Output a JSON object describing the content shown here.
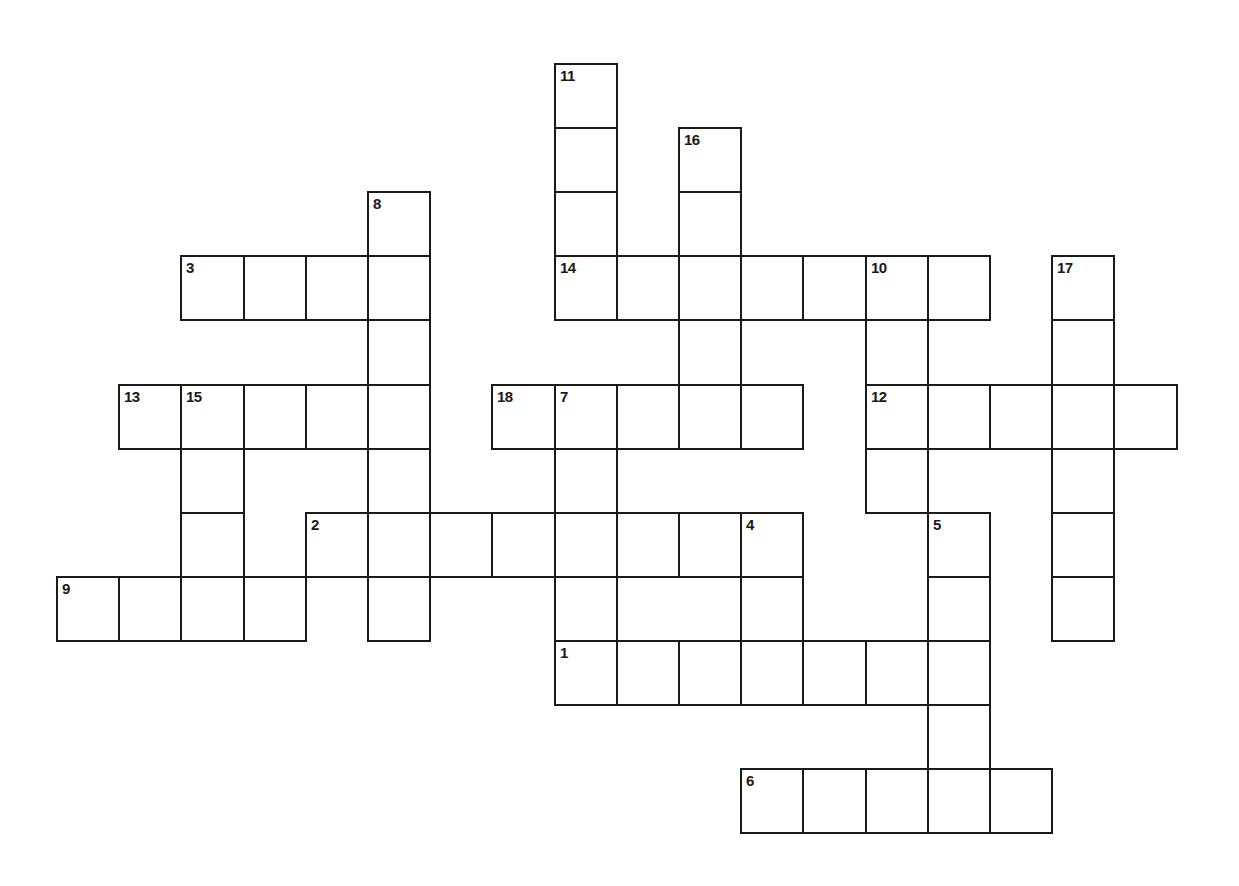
{
  "puzzle": {
    "grid": {
      "origin_x": 57,
      "origin_y": 64,
      "cell_w": 62.2,
      "cell_h": 64.1,
      "line_color": "#1a1a1a",
      "fill_color": "#ffffff"
    },
    "entries": [
      {
        "number": "1",
        "direction": "across",
        "row": 9,
        "col": 8,
        "length": 7
      },
      {
        "number": "2",
        "direction": "across",
        "row": 7,
        "col": 4,
        "length": 8
      },
      {
        "number": "3",
        "direction": "across",
        "row": 3,
        "col": 2,
        "length": 4
      },
      {
        "number": "4",
        "direction": "down",
        "row": 7,
        "col": 11,
        "length": 3
      },
      {
        "number": "5",
        "direction": "down",
        "row": 7,
        "col": 14,
        "length": 5
      },
      {
        "number": "6",
        "direction": "across",
        "row": 11,
        "col": 11,
        "length": 5
      },
      {
        "number": "7",
        "direction": "down",
        "row": 5,
        "col": 8,
        "length": 5
      },
      {
        "number": "8",
        "direction": "down",
        "row": 2,
        "col": 5,
        "length": 7
      },
      {
        "number": "9",
        "direction": "across",
        "row": 8,
        "col": 0,
        "length": 4
      },
      {
        "number": "10",
        "direction": "down",
        "row": 3,
        "col": 13,
        "length": 4
      },
      {
        "number": "11",
        "direction": "down",
        "row": 0,
        "col": 8,
        "length": 4
      },
      {
        "number": "12",
        "direction": "across",
        "row": 5,
        "col": 13,
        "length": 5
      },
      {
        "number": "13",
        "direction": "across",
        "row": 5,
        "col": 1,
        "length": 5
      },
      {
        "number": "14",
        "direction": "across",
        "row": 3,
        "col": 8,
        "length": 7
      },
      {
        "number": "15",
        "direction": "down",
        "row": 5,
        "col": 2,
        "length": 4
      },
      {
        "number": "16",
        "direction": "down",
        "row": 1,
        "col": 10,
        "length": 5
      },
      {
        "number": "17",
        "direction": "down",
        "row": 3,
        "col": 16,
        "length": 6
      },
      {
        "number": "18",
        "direction": "across",
        "row": 5,
        "col": 7,
        "length": 5
      }
    ]
  }
}
